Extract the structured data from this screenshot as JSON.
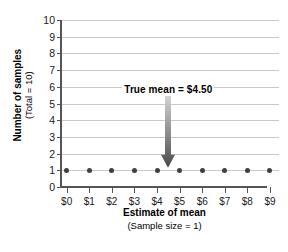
{
  "chart_data": {
    "type": "scatter",
    "title": "",
    "xlabel": "Estimate of mean",
    "xlabel_sub": "(Sample size = 1)",
    "ylabel": "Number of samples",
    "ylabel_sub": "(Total = 10)",
    "x_tick_labels": [
      "$0",
      "$1",
      "$2",
      "$3",
      "$4",
      "$5",
      "$6",
      "$7",
      "$8",
      "$9"
    ],
    "x_values": [
      0,
      1,
      2,
      3,
      4,
      5,
      6,
      7,
      8,
      9
    ],
    "y_tick_labels": [
      "0",
      "1",
      "2",
      "3",
      "4",
      "5",
      "6",
      "7",
      "8",
      "9",
      "10"
    ],
    "y_values": [
      1,
      1,
      1,
      1,
      1,
      1,
      1,
      1,
      1,
      1
    ],
    "xlim": [
      -0.25,
      9.4
    ],
    "ylim": [
      0,
      10
    ],
    "grid": true,
    "legend": false,
    "point_color": "#404040",
    "gridline_color": "#c9c9c9",
    "axis_color": "#555555",
    "annotations": [
      {
        "text": "True mean  =  $4.50",
        "x": 4.5,
        "y_text": 5.75,
        "y_arrow_top": 5.45,
        "y_arrow_tip": 1.15,
        "arrow_color_top": "#d4d4d4",
        "arrow_color_bottom": "#4a4a4a"
      }
    ]
  }
}
